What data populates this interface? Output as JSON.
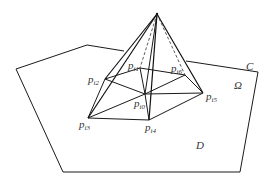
{
  "diagram": {
    "type": "pyramid-over-polygonal-domain",
    "colors": {
      "line": "#1a1a1a",
      "text": "#333333",
      "background": "#ffffff"
    },
    "region_labels": {
      "boundary": "C",
      "subdomain": "Ω",
      "domain": "D"
    },
    "vertices": [
      {
        "id": "p_i0",
        "base": "p",
        "sub": "i0"
      },
      {
        "id": "p_i1",
        "base": "p",
        "sub": "i1"
      },
      {
        "id": "p_i2",
        "base": "p",
        "sub": "i2"
      },
      {
        "id": "p_i3",
        "base": "p",
        "sub": "i3"
      },
      {
        "id": "p_i4",
        "base": "p",
        "sub": "i4"
      },
      {
        "id": "p_i5",
        "base": "p",
        "sub": "i5"
      },
      {
        "id": "p_i6",
        "base": "p",
        "sub": "i6"
      }
    ],
    "apex": "top vertex of pyramid above p_i0"
  }
}
